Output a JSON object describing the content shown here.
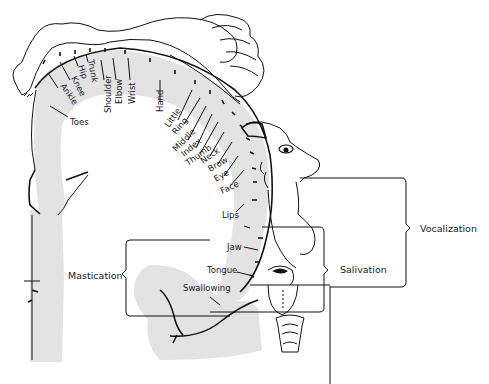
{
  "figure": {
    "type": "motor homunculus (cortical representation diagram)",
    "body_part_labels": [
      {
        "id": "toes",
        "label": "Toes",
        "x": 62,
        "y": 122,
        "rot": 0
      },
      {
        "id": "ankle",
        "label": "Ankle",
        "x": 60,
        "y": 90,
        "rot": 55
      },
      {
        "id": "knee",
        "label": "Knee",
        "x": 72,
        "y": 80,
        "rot": 62
      },
      {
        "id": "hip",
        "label": "Hip",
        "x": 80,
        "y": 66,
        "rot": 72
      },
      {
        "id": "trunk",
        "label": "Trunk",
        "x": 88,
        "y": 60,
        "rot": 80
      },
      {
        "id": "shoulder",
        "label": "Shoulder",
        "x": 106,
        "y": 113,
        "rot": -90
      },
      {
        "id": "elbow",
        "label": "Elbow",
        "x": 119,
        "y": 104,
        "rot": -90
      },
      {
        "id": "wrist",
        "label": "Wrist",
        "x": 132,
        "y": 104,
        "rot": -90
      },
      {
        "id": "hand",
        "label": "Hand",
        "x": 163,
        "y": 112,
        "rot": -90
      },
      {
        "id": "little",
        "label": "Little",
        "x": 169,
        "y": 128,
        "rot": -55
      },
      {
        "id": "ring",
        "label": "Ring",
        "x": 176,
        "y": 135,
        "rot": -50
      },
      {
        "id": "middle",
        "label": "Middle",
        "x": 176,
        "y": 152,
        "rot": -45
      },
      {
        "id": "index",
        "label": "Index",
        "x": 184,
        "y": 155,
        "rot": -40
      },
      {
        "id": "thumb",
        "label": "Thumb",
        "x": 188,
        "y": 163,
        "rot": -35
      },
      {
        "id": "neck",
        "label": "Neck",
        "x": 202,
        "y": 163,
        "rot": -35
      },
      {
        "id": "brow",
        "label": "Brow",
        "x": 210,
        "y": 171,
        "rot": -30
      },
      {
        "id": "eye",
        "label": "Eye",
        "x": 216,
        "y": 180,
        "rot": -30
      },
      {
        "id": "face",
        "label": "Face",
        "x": 222,
        "y": 192,
        "rot": -25
      },
      {
        "id": "lips",
        "label": "Lips",
        "x": 224,
        "y": 218,
        "rot": 0
      },
      {
        "id": "jaw",
        "label": "Jaw",
        "x": 227,
        "y": 251,
        "rot": 0
      },
      {
        "id": "tongue",
        "label": "Tongue",
        "x": 207,
        "y": 273,
        "rot": 0
      },
      {
        "id": "swallowing",
        "label": "Swallowing",
        "x": 183,
        "y": 290,
        "rot": 0
      }
    ],
    "function_labels": {
      "mastication": "Mastication",
      "salivation": "Salivation",
      "vocalization": "Vocalization"
    },
    "caption": "FIGURE — Somatotopic representation of motor cortex"
  },
  "colors": {
    "ink": "#111111",
    "cortex_fill": "#e3e3e3",
    "background": "#ffffff"
  }
}
